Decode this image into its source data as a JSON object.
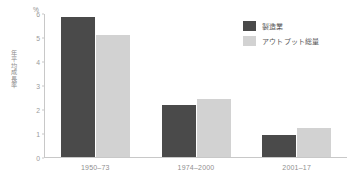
{
  "chart_data": {
    "type": "bar",
    "title": "",
    "subtitle": "",
    "xlabel": "",
    "ylabel": "年平均成長率",
    "yunit": "%",
    "ylim": [
      0,
      6
    ],
    "yticks": [
      0,
      1,
      2,
      3,
      4,
      5,
      6
    ],
    "ytick_labels": [
      "0",
      "1",
      "2",
      "3",
      "4",
      "5",
      "6"
    ],
    "grid": false,
    "legend_position": "top-right",
    "categories": [
      "1950–73",
      "1974–2000",
      "2001–17"
    ],
    "series": [
      {
        "name": "製造業",
        "color": "#4a4a4a",
        "values": [
          5.85,
          2.15,
          0.9
        ]
      },
      {
        "name": "アウトプット総量",
        "color": "#d2d2d2",
        "values": [
          5.1,
          2.4,
          1.2
        ]
      }
    ]
  },
  "colors": {
    "axis": "#c8c8c8",
    "tick_text": "#9a9a9a",
    "category_text": "#8f8f8f",
    "legend_text": "#555555",
    "background": "#ffffff"
  }
}
